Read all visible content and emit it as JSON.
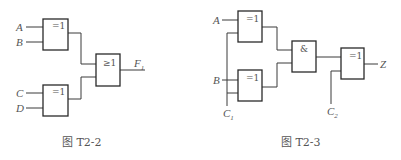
{
  "figures": [
    {
      "caption": "图 T2-2",
      "inputs": [
        {
          "name": "A"
        },
        {
          "name": "B"
        },
        {
          "name": "C"
        },
        {
          "name": "D"
        }
      ],
      "gates": [
        {
          "id": "g1",
          "symbol": "=1",
          "type": "XOR",
          "inputs": [
            "A",
            "B"
          ]
        },
        {
          "id": "g2",
          "symbol": "=1",
          "type": "XOR",
          "inputs": [
            "C",
            "D"
          ]
        },
        {
          "id": "g3",
          "symbol": "≥1",
          "type": "OR",
          "inputs": [
            "g1",
            "g2"
          ]
        }
      ],
      "output": {
        "name": "F",
        "subscript": "1"
      }
    },
    {
      "caption": "图 T2-3",
      "inputs": [
        {
          "name": "A"
        },
        {
          "name": "B"
        },
        {
          "name": "C",
          "subscript": "1"
        },
        {
          "name": "C",
          "subscript": "2"
        }
      ],
      "gates": [
        {
          "id": "g1",
          "symbol": "=1",
          "type": "XOR",
          "inputs": [
            "A",
            "C1"
          ]
        },
        {
          "id": "g2",
          "symbol": "=1",
          "type": "XOR",
          "inputs": [
            "B",
            "C1"
          ]
        },
        {
          "id": "g3",
          "symbol": "&",
          "type": "AND",
          "inputs": [
            "g1",
            "g2"
          ]
        },
        {
          "id": "g4",
          "symbol": "=1",
          "type": "XOR",
          "inputs": [
            "g3",
            "C2"
          ]
        }
      ],
      "output": {
        "name": "Z"
      }
    }
  ]
}
